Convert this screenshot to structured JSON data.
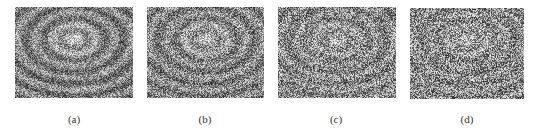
{
  "figure": {
    "panels": [
      {
        "label": "(a)",
        "image": "noisy-texture-with-faint-bowl-pattern",
        "box": {
          "x": 15,
          "y": 7,
          "w": 118,
          "h": 91
        },
        "caption_pos": {
          "x": 54,
          "y": 113
        },
        "seed": 11,
        "pattern_strength": 0.42
      },
      {
        "label": "(b)",
        "image": "noisy-texture-with-faint-bowl-pattern",
        "box": {
          "x": 147,
          "y": 7,
          "w": 117,
          "h": 91
        },
        "caption_pos": {
          "x": 185,
          "y": 113
        },
        "seed": 23,
        "pattern_strength": 0.34
      },
      {
        "label": "(c)",
        "image": "noisy-texture-with-faint-bowl-pattern",
        "box": {
          "x": 278,
          "y": 7,
          "w": 118,
          "h": 91
        },
        "caption_pos": {
          "x": 316,
          "y": 113
        },
        "seed": 37,
        "pattern_strength": 0.26
      },
      {
        "label": "(d)",
        "image": "noisy-texture-with-faint-bowl-pattern",
        "box": {
          "x": 410,
          "y": 8,
          "w": 114,
          "h": 91
        },
        "caption_pos": {
          "x": 447,
          "y": 113
        },
        "seed": 53,
        "pattern_strength": 0.22
      }
    ],
    "colors": {
      "background": "#ffffff",
      "caption": "#333333"
    }
  }
}
